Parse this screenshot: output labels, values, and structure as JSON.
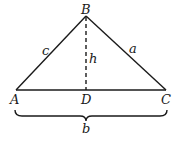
{
  "diagram": {
    "type": "triangle-with-altitude",
    "vertices": {
      "A": {
        "label": "A",
        "x": 16,
        "y": 90
      },
      "B": {
        "label": "B",
        "x": 86,
        "y": 16
      },
      "C": {
        "label": "C",
        "x": 166,
        "y": 90
      },
      "D": {
        "label": "D",
        "x": 86,
        "y": 90
      }
    },
    "sides": {
      "c": {
        "label": "c",
        "from": "A",
        "to": "B"
      },
      "a": {
        "label": "a",
        "from": "B",
        "to": "C"
      },
      "b": {
        "label": "b",
        "from": "A",
        "to": "C"
      }
    },
    "altitude": {
      "label": "h",
      "from": "B",
      "to": "D",
      "style": "dashed"
    },
    "brace": {
      "label": "b",
      "spans": "A-C"
    }
  }
}
